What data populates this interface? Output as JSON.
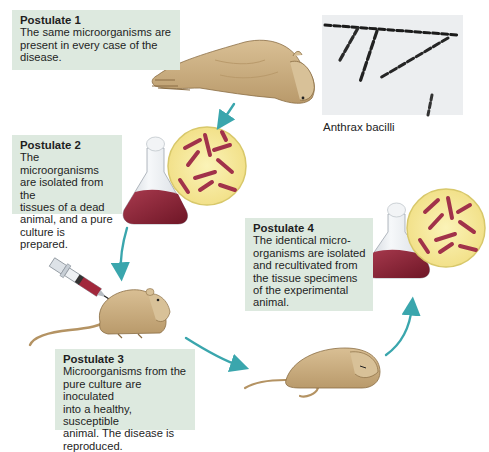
{
  "diagram": {
    "accent_color": "#3aa6ad",
    "box_color": "#dde9df",
    "postulates": [
      {
        "label": "Postulate 1",
        "text": "The same microorganisms are\npresent in every case of the\ndisease."
      },
      {
        "label": "Postulate 2",
        "text": "The microorganisms\nare isolated from the\ntissues of a dead\nanimal, and a pure\nculture is prepared."
      },
      {
        "label": "Postulate 3",
        "text": "Microorganisms from the\npure culture are inoculated\ninto a healthy, susceptible\nanimal. The disease is\nreproduced."
      },
      {
        "label": "Postulate 4",
        "text": "The identical micro-\norganisms are isolated\nand recultivated from\nthe tissue specimens\nof the experimental\nanimal."
      }
    ],
    "photo": {
      "caption": "Anthrax bacilli"
    },
    "illustrations": [
      "dead-sheep",
      "culture-flask",
      "bacteria-magnified-circle",
      "syringe",
      "healthy-mouse",
      "dead-mouse",
      "culture-flask-recultivated",
      "bacteria-magnified-circle-recultivated"
    ],
    "arrows": [
      "sheep-to-flask",
      "flask-to-mouse",
      "mouse-to-dead-mouse",
      "dead-mouse-to-flask"
    ]
  }
}
